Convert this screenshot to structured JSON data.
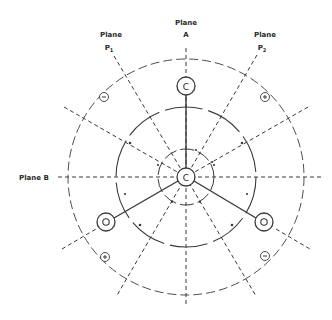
{
  "diagram": {
    "center": {
      "x": 186,
      "y": 177
    },
    "colors": {
      "line": "#3a3a3a",
      "background": "#ffffff"
    },
    "planes": [
      {
        "id": "A",
        "label_line1": "Plane",
        "label_line2": "A",
        "angle_deg": 90
      },
      {
        "id": "B",
        "label": "Plane B",
        "angle_deg": 0
      },
      {
        "id": "P1",
        "label_line1": "Plane",
        "label_line2": "P",
        "subscript": "1",
        "angle_deg": 120
      },
      {
        "id": "P2",
        "label_line1": "Plane",
        "label_line2": "P",
        "subscript": "2",
        "angle_deg": 60
      }
    ],
    "atoms": [
      {
        "id": "center",
        "label": "C",
        "x": 186,
        "y": 177
      },
      {
        "id": "top",
        "label": "C",
        "x": 186,
        "y": 86
      },
      {
        "id": "bottom-left",
        "label": "O",
        "x": 106,
        "y": 222
      },
      {
        "id": "bottom-right",
        "label": "O",
        "x": 264,
        "y": 222
      }
    ],
    "signs": [
      {
        "id": "upper-left",
        "label": "−",
        "x": 104,
        "y": 97
      },
      {
        "id": "upper-right",
        "label": "+",
        "x": 265,
        "y": 97
      },
      {
        "id": "lower-left",
        "label": "+",
        "x": 105,
        "y": 257
      },
      {
        "id": "lower-right",
        "label": "−",
        "x": 265,
        "y": 256
      }
    ],
    "circles": [
      {
        "id": "inner",
        "radius": 28
      },
      {
        "id": "middle",
        "radius": 70
      },
      {
        "id": "outer",
        "radius": 118
      }
    ]
  }
}
